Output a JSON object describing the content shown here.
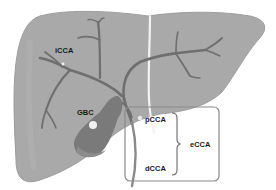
{
  "diagram": {
    "labels": {
      "icca": "iCCA",
      "gbc": "GBC",
      "pcca": "pCCA",
      "dcca": "dCCA",
      "ecca": "eCCA"
    },
    "colors": {
      "liver": "#a9a9a9",
      "liver_edge": "#9a9a9a",
      "ducts": "#6f6f6f",
      "gallbladder": "#7a7a7a",
      "gallbladder_fundus": "#8c8c8c",
      "ligament": "#f2f2f2",
      "box_stroke": "#8a8a8a",
      "text": "#1a1a1a"
    }
  }
}
